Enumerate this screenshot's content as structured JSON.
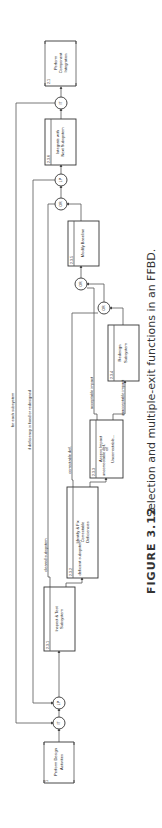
{
  "figure": {
    "caption_label": "FIGURE 3.12",
    "caption_text": "Selection and multiple-exit functions in an FFBD."
  },
  "functions": [
    {
      "id": "1",
      "label_lines": [
        "Perform Design",
        "Activities"
      ]
    },
    {
      "id": "2.3.1",
      "label_lines": [
        "Inspect & Test",
        "Subsystem"
      ]
    },
    {
      "id": "2.3.2",
      "label_lines": [
        "Identify & Fix",
        "Correctable",
        "Deficiencies"
      ]
    },
    {
      "id": "2.3.3",
      "label_lines": [
        "Assess Impact",
        "of",
        "Uncorrectable..."
      ]
    },
    {
      "id": "2.3.4",
      "label_lines": [
        "Redesign",
        "Subsystem"
      ]
    },
    {
      "id": "2.3.5",
      "label_lines": [
        "Modify Baseline"
      ]
    },
    {
      "id": "2.3.6",
      "label_lines": [
        "Integrate with",
        "Next Subsystem"
      ]
    },
    {
      "id": "2.1",
      "label_lines": [
        "Perform",
        "Component",
        "Integration"
      ]
    }
  ],
  "nodes": {
    "it": "IT",
    "lp": "LP",
    "or": "OR"
  },
  "edge_labels": {
    "for_each": "for each subsystem",
    "if_deficiency": "if deficiency is fixed or redesigned",
    "cleared": "cleared subsystem",
    "deficient": "deficient subsystem",
    "correctable": "correctable def.",
    "uncorrectable": "uncorrectable def.",
    "acceptable": "acceptable impact",
    "unacceptable": "unacceptable impact"
  }
}
